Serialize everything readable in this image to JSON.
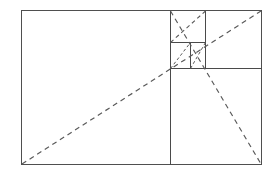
{
  "diagram": {
    "background_color": "#ffffff",
    "line_color": "#4a4a4a",
    "dash_color": "#5a5a5a",
    "canvas": {
      "width": 277,
      "height": 172
    },
    "outer_rectangle": {
      "name": "outer-rectangle",
      "x": 21.5,
      "y": 10.5,
      "width": 240,
      "height": 154
    },
    "divisions": [
      {
        "name": "major-vertical-divider",
        "orientation": "vertical",
        "x": 170.5,
        "y1": 10.5,
        "y2": 164.5
      },
      {
        "name": "major-horizontal-divider",
        "orientation": "horizontal",
        "y": 68.5,
        "x1": 170.5,
        "x2": 261.5
      },
      {
        "name": "secondary-vertical-divider",
        "orientation": "vertical",
        "x": 205.5,
        "y1": 10.5,
        "y2": 68.5
      },
      {
        "name": "secondary-horizontal-divider",
        "orientation": "horizontal",
        "y": 42.5,
        "x1": 170.5,
        "x2": 205.5
      },
      {
        "name": "tertiary-vertical-divider",
        "orientation": "vertical",
        "x": 190.5,
        "y1": 42.5,
        "y2": 68.5
      }
    ],
    "diagonals": [
      {
        "name": "primary-diagonal",
        "x1": 22,
        "y1": 164,
        "x2": 261,
        "y2": 11,
        "style": "dashed"
      },
      {
        "name": "secondary-diagonal",
        "x1": 170.5,
        "y1": 11,
        "x2": 261,
        "y2": 164,
        "style": "dashed"
      },
      {
        "name": "tertiary-diagonal",
        "x1": 170.5,
        "y1": 42.5,
        "x2": 205.5,
        "y2": 11,
        "style": "dashed"
      },
      {
        "name": "quaternary-diagonal",
        "x1": 170.5,
        "y1": 68.5,
        "x2": 190.5,
        "y2": 42.5,
        "style": "dashed"
      },
      {
        "name": "quinary-diagonal",
        "x1": 190.5,
        "y1": 68.5,
        "x2": 205.5,
        "y2": 42.5,
        "style": "dashed"
      }
    ]
  }
}
